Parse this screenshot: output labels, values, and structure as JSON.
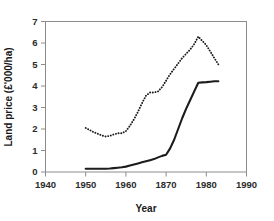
{
  "chart_data": {
    "type": "line",
    "title": "",
    "xlabel": "Year",
    "ylabel": "Land price (£'000/ha)",
    "xlim": [
      1940,
      1990
    ],
    "ylim": [
      0,
      7
    ],
    "xticks": [
      1940,
      1950,
      1960,
      1870,
      1980,
      1990
    ],
    "xtick_values": [
      1940,
      1950,
      1960,
      1970,
      1980,
      1990
    ],
    "yticks": [
      0,
      1,
      2,
      3,
      4,
      5,
      6,
      7
    ],
    "grid": false,
    "legend": "none",
    "series": [
      {
        "name": "real-price-dotted",
        "style": "dotted",
        "color": "#1c1c1c",
        "x": [
          1950,
          1951,
          1952,
          1953,
          1954,
          1955,
          1956,
          1957,
          1958,
          1959,
          1960,
          1961,
          1962,
          1963,
          1964,
          1965,
          1966,
          1967,
          1968,
          1969,
          1970,
          1971,
          1972,
          1973,
          1974,
          1975,
          1976,
          1977,
          1978,
          1979,
          1980,
          1981,
          1982,
          1983
        ],
        "values": [
          2.05,
          1.95,
          1.85,
          1.78,
          1.7,
          1.65,
          1.68,
          1.75,
          1.8,
          1.8,
          1.9,
          2.15,
          2.45,
          2.8,
          3.2,
          3.55,
          3.7,
          3.7,
          3.75,
          3.95,
          4.25,
          4.55,
          4.8,
          5.05,
          5.3,
          5.5,
          5.7,
          5.95,
          6.3,
          6.1,
          5.9,
          5.6,
          5.3,
          5.0
        ]
      },
      {
        "name": "nominal-price-solid",
        "style": "solid",
        "color": "#1c1c1c",
        "x": [
          1950,
          1951,
          1952,
          1953,
          1954,
          1955,
          1956,
          1957,
          1958,
          1959,
          1960,
          1961,
          1962,
          1963,
          1964,
          1965,
          1966,
          1967,
          1968,
          1969,
          1970,
          1971,
          1972,
          1973,
          1974,
          1975,
          1976,
          1977,
          1978,
          1979,
          1980,
          1981,
          1982,
          1983
        ],
        "values": [
          0.15,
          0.15,
          0.15,
          0.15,
          0.15,
          0.15,
          0.16,
          0.18,
          0.2,
          0.22,
          0.25,
          0.3,
          0.35,
          0.4,
          0.45,
          0.5,
          0.55,
          0.6,
          0.68,
          0.75,
          0.8,
          1.1,
          1.5,
          2.0,
          2.5,
          2.95,
          3.35,
          3.75,
          4.15,
          4.17,
          4.18,
          4.2,
          4.22,
          4.22
        ]
      }
    ]
  },
  "axis": {
    "x_title": "Year",
    "y_title": "Land price (£'000/ha)"
  }
}
